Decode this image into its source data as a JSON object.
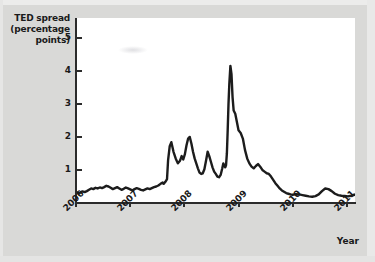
{
  "chart_data": {
    "type": "line",
    "title": "",
    "ylabel": "TED spread (percentage points)",
    "ylabel_lines": [
      "TED spread",
      "(percentage",
      "points)"
    ],
    "xlabel": "Year",
    "xlim": [
      2006.0,
      2011.15
    ],
    "ylim": [
      0,
      5.6
    ],
    "yticks": [
      1,
      2,
      3,
      4,
      5
    ],
    "ytick_labels": [
      "1",
      "2",
      "3",
      "4",
      "5"
    ],
    "xticks": [
      2006,
      2007,
      2008,
      2009,
      2010,
      2011
    ],
    "xtick_labels": [
      "2006",
      "2007",
      "2008",
      "2009",
      "2010",
      "2011"
    ],
    "xtick_rotation": -45,
    "grid": false,
    "legend": null,
    "series": [
      {
        "name": "TED spread",
        "color": "#1c1c1c",
        "x": [
          2006.0,
          2006.04,
          2006.08,
          2006.12,
          2006.16,
          2006.2,
          2006.24,
          2006.28,
          2006.32,
          2006.36,
          2006.4,
          2006.44,
          2006.48,
          2006.52,
          2006.56,
          2006.6,
          2006.64,
          2006.68,
          2006.72,
          2006.76,
          2006.8,
          2006.84,
          2006.88,
          2006.92,
          2006.96,
          2007.0,
          2007.04,
          2007.08,
          2007.12,
          2007.16,
          2007.2,
          2007.24,
          2007.28,
          2007.32,
          2007.36,
          2007.4,
          2007.44,
          2007.48,
          2007.52,
          2007.56,
          2007.6,
          2007.62,
          2007.65,
          2007.68,
          2007.7,
          2007.73,
          2007.76,
          2007.8,
          2007.84,
          2007.88,
          2007.92,
          2007.95,
          2007.98,
          2008.01,
          2008.04,
          2008.07,
          2008.1,
          2008.13,
          2008.16,
          2008.19,
          2008.22,
          2008.25,
          2008.28,
          2008.31,
          2008.34,
          2008.37,
          2008.4,
          2008.43,
          2008.46,
          2008.49,
          2008.52,
          2008.55,
          2008.58,
          2008.61,
          2008.64,
          2008.67,
          2008.7,
          2008.72,
          2008.74,
          2008.755,
          2008.77,
          2008.785,
          2008.8,
          2008.815,
          2008.83,
          2008.85,
          2008.87,
          2008.89,
          2008.91,
          2008.94,
          2008.97,
          2009.0,
          2009.04,
          2009.08,
          2009.12,
          2009.16,
          2009.2,
          2009.24,
          2009.28,
          2009.32,
          2009.36,
          2009.4,
          2009.44,
          2009.48,
          2009.52,
          2009.56,
          2009.6,
          2009.64,
          2009.68,
          2009.72,
          2009.76,
          2009.8,
          2009.84,
          2009.88,
          2009.92,
          2009.96,
          2010.0,
          2010.06,
          2010.12,
          2010.18,
          2010.24,
          2010.3,
          2010.36,
          2010.42,
          2010.48,
          2010.54,
          2010.6,
          2010.66,
          2010.72,
          2010.78,
          2010.84,
          2010.9,
          2010.96,
          2011.02,
          2011.08,
          2011.14
        ],
        "y": [
          0.34,
          0.3,
          0.32,
          0.35,
          0.33,
          0.36,
          0.4,
          0.44,
          0.42,
          0.46,
          0.44,
          0.47,
          0.45,
          0.48,
          0.52,
          0.5,
          0.46,
          0.42,
          0.45,
          0.48,
          0.44,
          0.4,
          0.43,
          0.47,
          0.44,
          0.41,
          0.38,
          0.42,
          0.45,
          0.43,
          0.4,
          0.38,
          0.41,
          0.44,
          0.42,
          0.45,
          0.48,
          0.5,
          0.53,
          0.58,
          0.62,
          0.58,
          0.64,
          0.72,
          1.3,
          1.72,
          1.84,
          1.55,
          1.35,
          1.2,
          1.28,
          1.42,
          1.32,
          1.48,
          1.75,
          1.95,
          2.0,
          1.8,
          1.55,
          1.35,
          1.2,
          1.05,
          0.92,
          0.88,
          0.9,
          1.02,
          1.28,
          1.55,
          1.42,
          1.25,
          1.08,
          0.95,
          0.88,
          0.8,
          0.78,
          0.85,
          1.05,
          1.2,
          1.12,
          1.08,
          1.15,
          1.5,
          2.2,
          3.0,
          3.6,
          4.15,
          3.9,
          3.2,
          2.8,
          2.7,
          2.45,
          2.2,
          2.12,
          1.95,
          1.6,
          1.35,
          1.2,
          1.1,
          1.05,
          1.12,
          1.18,
          1.1,
          1.0,
          0.95,
          0.9,
          0.88,
          0.8,
          0.7,
          0.6,
          0.52,
          0.44,
          0.38,
          0.34,
          0.3,
          0.28,
          0.26,
          0.25,
          0.27,
          0.26,
          0.24,
          0.22,
          0.2,
          0.19,
          0.21,
          0.26,
          0.36,
          0.44,
          0.42,
          0.36,
          0.28,
          0.24,
          0.22,
          0.21,
          0.2,
          0.22,
          0.25
        ]
      }
    ]
  },
  "axes": {
    "y_title_lines": [
      "TED spread",
      "(percentage",
      "points)"
    ],
    "x_title": "Year"
  }
}
